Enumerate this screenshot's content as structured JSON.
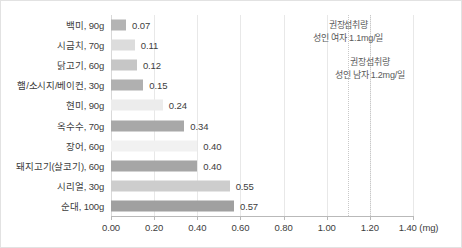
{
  "chart_data": {
    "type": "bar",
    "orientation": "horizontal",
    "title": "",
    "xlabel": "(mg)",
    "ylabel": "",
    "xlim": [
      0.0,
      1.4
    ],
    "xticks": [
      "0.00",
      "0.20",
      "0.40",
      "0.60",
      "0.80",
      "1.00",
      "1.20",
      "1.40"
    ],
    "xtick_values": [
      0.0,
      0.2,
      0.4,
      0.6,
      0.8,
      1.0,
      1.2,
      1.4
    ],
    "unit_label": "(mg)",
    "grid": true,
    "legend": "none",
    "categories": [
      "백미, 90g",
      "시금치, 70g",
      "닭고기, 60g",
      "햄/소시지/베이컨, 30g",
      "현미, 90g",
      "옥수수, 70g",
      "장어, 60g",
      "돼지고기(살코기), 60g",
      "시리얼, 30g",
      "순대, 100g"
    ],
    "values": [
      0.07,
      0.11,
      0.12,
      0.15,
      0.24,
      0.34,
      0.4,
      0.4,
      0.55,
      0.57
    ],
    "value_labels": [
      "0.07",
      "0.11",
      "0.12",
      "0.15",
      "0.24",
      "0.34",
      "0.40",
      "0.40",
      "0.55",
      "0.57"
    ],
    "bar_colors": [
      "#b4b4b4",
      "#dcdcdc",
      "#c6c6c6",
      "#b0b0b0",
      "#ececec",
      "#a8a8a8",
      "#f1f1f1",
      "#a6a6a6",
      "#cdcdcd",
      "#a0a0a0"
    ],
    "reference_lines": [
      {
        "value": 1.1,
        "label_line1": "권장섭취량",
        "label_line2": "성인 여자 1.1mg/일",
        "color": "#c9c9c9"
      },
      {
        "value": 1.2,
        "label_line1": "권장섭취량",
        "label_line2": "성인 남자 1.2mg/일",
        "color": "#c9c9c9"
      }
    ]
  },
  "colors": {
    "grid": "#e8e8e8",
    "axis": "#b9b9b9",
    "text": "#3d3d3d",
    "annotation_text": "#5a5a5a",
    "border": "#e2e2e2",
    "background": "#ffffff"
  }
}
